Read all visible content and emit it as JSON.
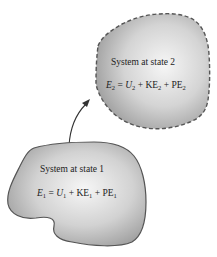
{
  "diagram": {
    "state2": {
      "label": "System at state 2",
      "energy_symbol": "E",
      "sub": "2",
      "terms": [
        "U",
        "KE",
        "PE"
      ],
      "border": "dashed"
    },
    "state1": {
      "label": "System at state 1",
      "energy_symbol": "E",
      "sub": "1",
      "terms": [
        "U",
        "KE",
        "PE"
      ],
      "border": "solid"
    },
    "arrow": {
      "from": "state1",
      "to": "state2"
    },
    "colors": {
      "fill_light": "#f4f4f4",
      "fill_dark": "#9a9a9a",
      "border": "#555555"
    }
  }
}
